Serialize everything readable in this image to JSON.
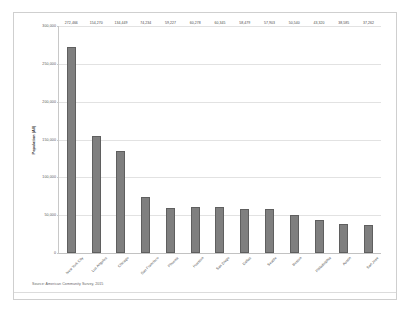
{
  "chart_data": {
    "type": "bar",
    "title": "",
    "xlabel": "",
    "ylabel": "Population (All)",
    "ylim": [
      0,
      300000
    ],
    "yticks": [
      0,
      50000,
      100000,
      150000,
      200000,
      250000,
      300000
    ],
    "ytick_labels": [
      "0",
      "50,000",
      "100,000",
      "150,000",
      "200,000",
      "250,000",
      "300,000"
    ],
    "grid": true,
    "legend": "none",
    "bar_color": "#7f7f7f",
    "categories": [
      "New York City",
      "Los Angeles",
      "Chicago",
      "San Francisco",
      "Phoenix",
      "Houston",
      "San Diego",
      "Dallas",
      "Seattle",
      "Boston",
      "Philadelphia",
      "Austin",
      "San Jose"
    ],
    "values": [
      272466,
      154270,
      134449,
      74234,
      59227,
      60278,
      60345,
      58479,
      57903,
      50540,
      43320,
      38585,
      37262
    ],
    "value_labels": [
      "272,466",
      "154,270",
      "134,449",
      "74,234",
      "59,227",
      "60,278",
      "60,345",
      "58,479",
      "57,903",
      "50,540",
      "43,320",
      "38,585",
      "37,262"
    ]
  },
  "footer": {
    "source": "Source: American Community Survey, 2015"
  }
}
